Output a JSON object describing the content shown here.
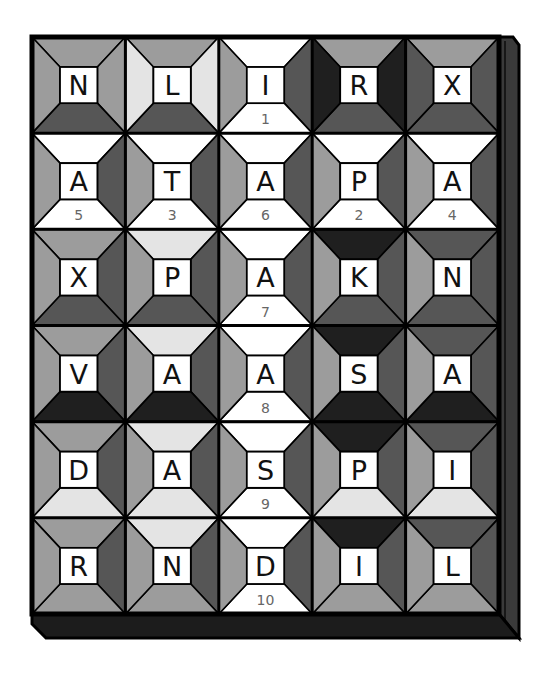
{
  "puzzle": {
    "grid": {
      "x": 32,
      "y": 37,
      "width": 467,
      "height": 577,
      "rows": 6,
      "cols": 5
    },
    "palette": {
      "W": "#ffffff",
      "L": "#e4e4e4",
      "M": "#9c9c9c",
      "D": "#565656",
      "K": "#1f1f1f",
      "frame": "#000000",
      "side_face": "#3a3a3a",
      "bottom_face": "#1c1c1c"
    },
    "cells": [
      [
        {
          "letter": "N",
          "number": "",
          "shades": [
            "M",
            "M",
            "D",
            "M"
          ]
        },
        {
          "letter": "L",
          "number": "",
          "shades": [
            "M",
            "L",
            "D",
            "L"
          ]
        },
        {
          "letter": "I",
          "number": "1",
          "shades": [
            "W",
            "D",
            "W",
            "M"
          ]
        },
        {
          "letter": "R",
          "number": "",
          "shades": [
            "M",
            "K",
            "D",
            "K"
          ]
        },
        {
          "letter": "X",
          "number": "",
          "shades": [
            "M",
            "D",
            "D",
            "D"
          ]
        }
      ],
      [
        {
          "letter": "A",
          "number": "5",
          "shades": [
            "W",
            "D",
            "W",
            "M"
          ]
        },
        {
          "letter": "T",
          "number": "3",
          "shades": [
            "W",
            "D",
            "W",
            "M"
          ]
        },
        {
          "letter": "A",
          "number": "6",
          "shades": [
            "W",
            "D",
            "W",
            "M"
          ]
        },
        {
          "letter": "P",
          "number": "2",
          "shades": [
            "W",
            "D",
            "W",
            "M"
          ]
        },
        {
          "letter": "A",
          "number": "4",
          "shades": [
            "W",
            "D",
            "W",
            "M"
          ]
        }
      ],
      [
        {
          "letter": "X",
          "number": "",
          "shades": [
            "M",
            "D",
            "D",
            "M"
          ]
        },
        {
          "letter": "P",
          "number": "",
          "shades": [
            "L",
            "D",
            "D",
            "M"
          ]
        },
        {
          "letter": "A",
          "number": "7",
          "shades": [
            "W",
            "D",
            "W",
            "M"
          ]
        },
        {
          "letter": "K",
          "number": "",
          "shades": [
            "K",
            "D",
            "D",
            "M"
          ]
        },
        {
          "letter": "N",
          "number": "",
          "shades": [
            "D",
            "D",
            "D",
            "M"
          ]
        }
      ],
      [
        {
          "letter": "V",
          "number": "",
          "shades": [
            "M",
            "D",
            "K",
            "M"
          ]
        },
        {
          "letter": "A",
          "number": "",
          "shades": [
            "L",
            "D",
            "K",
            "M"
          ]
        },
        {
          "letter": "A",
          "number": "8",
          "shades": [
            "W",
            "D",
            "W",
            "M"
          ]
        },
        {
          "letter": "S",
          "number": "",
          "shades": [
            "K",
            "D",
            "K",
            "M"
          ]
        },
        {
          "letter": "A",
          "number": "",
          "shades": [
            "D",
            "D",
            "K",
            "M"
          ]
        }
      ],
      [
        {
          "letter": "D",
          "number": "",
          "shades": [
            "M",
            "D",
            "L",
            "M"
          ]
        },
        {
          "letter": "A",
          "number": "",
          "shades": [
            "L",
            "D",
            "L",
            "M"
          ]
        },
        {
          "letter": "S",
          "number": "9",
          "shades": [
            "W",
            "D",
            "W",
            "M"
          ]
        },
        {
          "letter": "P",
          "number": "",
          "shades": [
            "K",
            "D",
            "L",
            "M"
          ]
        },
        {
          "letter": "I",
          "number": "",
          "shades": [
            "D",
            "D",
            "L",
            "M"
          ]
        }
      ],
      [
        {
          "letter": "R",
          "number": "",
          "shades": [
            "M",
            "D",
            "M",
            "M"
          ]
        },
        {
          "letter": "N",
          "number": "",
          "shades": [
            "L",
            "D",
            "M",
            "M"
          ]
        },
        {
          "letter": "D",
          "number": "10",
          "shades": [
            "W",
            "D",
            "W",
            "M"
          ]
        },
        {
          "letter": "I",
          "number": "",
          "shades": [
            "K",
            "D",
            "M",
            "M"
          ]
        },
        {
          "letter": "L",
          "number": "",
          "shades": [
            "D",
            "D",
            "M",
            "M"
          ]
        }
      ]
    ]
  }
}
